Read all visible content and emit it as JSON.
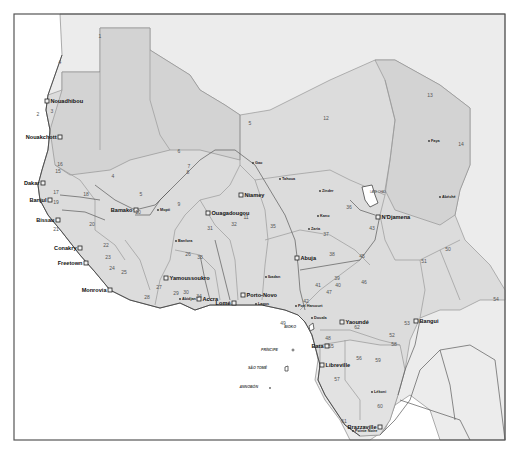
{
  "map": {
    "type": "reference-map",
    "region": "West and Central Africa",
    "colors": {
      "sea": "#ffffff",
      "land_outside": "#ececec",
      "region_fill": "#dcdcdc",
      "border": "#9a9a9a",
      "river": "#5a5a5a",
      "text": "#111111",
      "frame": "#555555"
    },
    "capitals": [
      {
        "name": "Nouadhibou",
        "x": 47,
        "y": 101
      },
      {
        "name": "Nouakchott",
        "x": 60,
        "y": 137
      },
      {
        "name": "Dakar",
        "x": 43,
        "y": 183
      },
      {
        "name": "Banjul",
        "x": 50,
        "y": 200
      },
      {
        "name": "Bissau",
        "x": 58,
        "y": 220
      },
      {
        "name": "Conakry",
        "x": 80,
        "y": 248
      },
      {
        "name": "Freetown",
        "x": 86,
        "y": 263
      },
      {
        "name": "Monrovia",
        "x": 110,
        "y": 290
      },
      {
        "name": "Bamako",
        "x": 136,
        "y": 210
      },
      {
        "name": "Ouagadougou",
        "x": 208,
        "y": 213
      },
      {
        "name": "Niamey",
        "x": 241,
        "y": 195
      },
      {
        "name": "Yamoussoukro",
        "x": 166,
        "y": 278
      },
      {
        "name": "Accra",
        "x": 199,
        "y": 299
      },
      {
        "name": "Lomé",
        "x": 234,
        "y": 303
      },
      {
        "name": "Porto-Novo",
        "x": 243,
        "y": 295
      },
      {
        "name": "Abuja",
        "x": 297,
        "y": 258
      },
      {
        "name": "N'Djamena",
        "x": 378,
        "y": 217
      },
      {
        "name": "Yaoundé",
        "x": 342,
        "y": 322
      },
      {
        "name": "Bangui",
        "x": 416,
        "y": 321
      },
      {
        "name": "Bata",
        "x": 327,
        "y": 346
      },
      {
        "name": "Libreville",
        "x": 322,
        "y": 365
      },
      {
        "name": "Brazzaville",
        "x": 380,
        "y": 427
      }
    ],
    "cities": [
      {
        "name": "Gao",
        "x": 253,
        "y": 163
      },
      {
        "name": "Tahoua",
        "x": 280,
        "y": 179
      },
      {
        "name": "Zinder",
        "x": 320,
        "y": 191
      },
      {
        "name": "Faya",
        "x": 429,
        "y": 141
      },
      {
        "name": "Abéché",
        "x": 440,
        "y": 197
      },
      {
        "name": "Kano",
        "x": 318,
        "y": 216
      },
      {
        "name": "Zaria",
        "x": 309,
        "y": 229
      },
      {
        "name": "Mopti",
        "x": 158,
        "y": 210
      },
      {
        "name": "Banfora",
        "x": 176,
        "y": 241
      },
      {
        "name": "Abidjan",
        "x": 180,
        "y": 299
      },
      {
        "name": "Lagos",
        "x": 256,
        "y": 304
      },
      {
        "name": "Ibadan",
        "x": 266,
        "y": 277
      },
      {
        "name": "Port Harcourt",
        "x": 296,
        "y": 306
      },
      {
        "name": "Douala",
        "x": 312,
        "y": 318
      },
      {
        "name": "Lékoni",
        "x": 372,
        "y": 392
      },
      {
        "name": "Pointe Noire",
        "x": 353,
        "y": 431
      }
    ],
    "islands": [
      {
        "name": "BIOKO",
        "x": 296,
        "y": 328
      },
      {
        "name": "PRÍNCIPE",
        "x": 278,
        "y": 351
      },
      {
        "name": "SÃO TOMÉ",
        "x": 267,
        "y": 369
      },
      {
        "name": "ANNOBÓN",
        "x": 258,
        "y": 388
      }
    ],
    "lakes": [
      {
        "name": "LAKE CHAD",
        "x": 370,
        "y": 193
      }
    ],
    "region_numbers": [
      {
        "n": "1",
        "x": 100,
        "y": 38
      },
      {
        "n": "2",
        "x": 38,
        "y": 116
      },
      {
        "n": "3",
        "x": 52,
        "y": 113
      },
      {
        "n": "4",
        "x": 60,
        "y": 64
      },
      {
        "n": "4",
        "x": 113,
        "y": 178
      },
      {
        "n": "5",
        "x": 250,
        "y": 125
      },
      {
        "n": "5",
        "x": 141,
        "y": 196
      },
      {
        "n": "6",
        "x": 179,
        "y": 153
      },
      {
        "n": "7",
        "x": 189,
        "y": 168
      },
      {
        "n": "8",
        "x": 188,
        "y": 174
      },
      {
        "n": "9",
        "x": 179,
        "y": 206
      },
      {
        "n": "10",
        "x": 138,
        "y": 214
      },
      {
        "n": "11",
        "x": 246,
        "y": 219
      },
      {
        "n": "12",
        "x": 326,
        "y": 120
      },
      {
        "n": "13",
        "x": 430,
        "y": 97
      },
      {
        "n": "14",
        "x": 461,
        "y": 146
      },
      {
        "n": "15",
        "x": 58,
        "y": 173
      },
      {
        "n": "16",
        "x": 60,
        "y": 166
      },
      {
        "n": "17",
        "x": 56,
        "y": 194
      },
      {
        "n": "18",
        "x": 86,
        "y": 196
      },
      {
        "n": "19",
        "x": 56,
        "y": 204
      },
      {
        "n": "20",
        "x": 92,
        "y": 226
      },
      {
        "n": "21",
        "x": 56,
        "y": 231
      },
      {
        "n": "22",
        "x": 106,
        "y": 247
      },
      {
        "n": "23",
        "x": 108,
        "y": 259
      },
      {
        "n": "24",
        "x": 112,
        "y": 270
      },
      {
        "n": "25",
        "x": 124,
        "y": 274
      },
      {
        "n": "26",
        "x": 188,
        "y": 256
      },
      {
        "n": "27",
        "x": 159,
        "y": 289
      },
      {
        "n": "28",
        "x": 147,
        "y": 299
      },
      {
        "n": "29",
        "x": 176,
        "y": 295
      },
      {
        "n": "30",
        "x": 186,
        "y": 294
      },
      {
        "n": "31",
        "x": 210,
        "y": 230
      },
      {
        "n": "32",
        "x": 234,
        "y": 226
      },
      {
        "n": "33",
        "x": 200,
        "y": 259
      },
      {
        "n": "34",
        "x": 199,
        "y": 298
      },
      {
        "n": "35",
        "x": 273,
        "y": 228
      },
      {
        "n": "36",
        "x": 349,
        "y": 209
      },
      {
        "n": "37",
        "x": 326,
        "y": 236
      },
      {
        "n": "38",
        "x": 332,
        "y": 256
      },
      {
        "n": "39",
        "x": 337,
        "y": 280
      },
      {
        "n": "40",
        "x": 338,
        "y": 287
      },
      {
        "n": "41",
        "x": 318,
        "y": 287
      },
      {
        "n": "42",
        "x": 306,
        "y": 303
      },
      {
        "n": "43",
        "x": 372,
        "y": 230
      },
      {
        "n": "45",
        "x": 362,
        "y": 258
      },
      {
        "n": "46",
        "x": 364,
        "y": 284
      },
      {
        "n": "47",
        "x": 329,
        "y": 294
      },
      {
        "n": "48",
        "x": 328,
        "y": 340
      },
      {
        "n": "49",
        "x": 283,
        "y": 325
      },
      {
        "n": "50",
        "x": 448,
        "y": 251
      },
      {
        "n": "51",
        "x": 424,
        "y": 263
      },
      {
        "n": "52",
        "x": 392,
        "y": 337
      },
      {
        "n": "53",
        "x": 407,
        "y": 325
      },
      {
        "n": "54",
        "x": 496,
        "y": 301
      },
      {
        "n": "55",
        "x": 331,
        "y": 348
      },
      {
        "n": "56",
        "x": 359,
        "y": 360
      },
      {
        "n": "57",
        "x": 337,
        "y": 381
      },
      {
        "n": "58",
        "x": 394,
        "y": 346
      },
      {
        "n": "59",
        "x": 378,
        "y": 362
      },
      {
        "n": "60",
        "x": 380,
        "y": 408
      },
      {
        "n": "61",
        "x": 344,
        "y": 423
      },
      {
        "n": "62",
        "x": 357,
        "y": 329
      }
    ]
  }
}
